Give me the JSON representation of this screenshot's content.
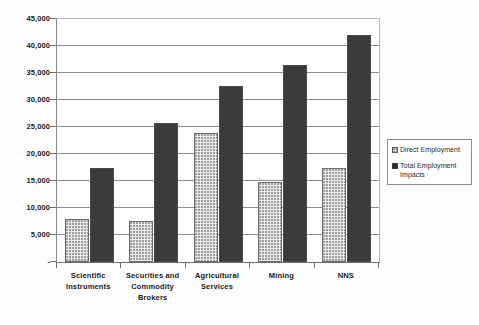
{
  "chart_data": {
    "type": "bar",
    "title": "",
    "subtitle": "",
    "xlabel": "",
    "ylabel": "",
    "categories": [
      "Scientific Instruments",
      "Securities and Commodity Brokers",
      "Agricultural Services",
      "Mining",
      "NNS"
    ],
    "category_lines": [
      [
        "Scientific",
        "Instruments"
      ],
      [
        "Securities and",
        "Commodity",
        "Brokers"
      ],
      [
        "Agricultural",
        "Services"
      ],
      [
        "Mining"
      ],
      [
        "NNS"
      ]
    ],
    "series": [
      {
        "name": "Direct Employment",
        "values": [
          7900,
          7600,
          23900,
          14900,
          17400
        ]
      },
      {
        "name": "Total Employment Impacts",
        "values": [
          17500,
          25800,
          32600,
          36500,
          42000
        ]
      }
    ],
    "ylim": [
      0,
      45000
    ],
    "ytick_values": [
      0,
      5000,
      10000,
      15000,
      20000,
      25000,
      30000,
      35000,
      40000,
      45000
    ],
    "ytick_labels": [
      "-",
      "5,000",
      "10,000",
      "15,000",
      "20,000",
      "25,000",
      "30,000",
      "35,000",
      "40,000",
      "45,000"
    ],
    "grid": true,
    "legend_position": "right",
    "legend": [
      {
        "label": "Direct Employment",
        "lines": [
          "Direct Employment"
        ],
        "pattern": "light-stipple"
      },
      {
        "label": "Total Employment Impacts",
        "lines": [
          "Total Employment",
          "Impacts"
        ],
        "pattern": "dark-stipple"
      }
    ],
    "colors": {
      "direct_fill": "#e8e8e8",
      "direct_border": "#6d6d6d",
      "total_fill": "#949494",
      "total_border": "#4a4a4a",
      "gridline": "#8d8d8d",
      "axis": "#6f6f6f",
      "text": "#1a1a1a",
      "background": "#ffffff"
    }
  }
}
